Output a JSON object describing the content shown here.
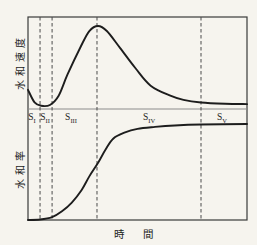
{
  "figure": {
    "x_axis_label": "時 間",
    "y_axis_label_top": "水和速度",
    "y_axis_label_bottom": "水和率",
    "stage_labels": [
      {
        "base": "S",
        "sub": "I"
      },
      {
        "base": "S",
        "sub": "II"
      },
      {
        "base": "S",
        "sub": "III"
      },
      {
        "base": "S",
        "sub": "IV"
      },
      {
        "base": "S",
        "sub": "V"
      }
    ],
    "stage_boundaries_t": [
      5.5,
      11,
      31.5,
      79
    ]
  },
  "colors": {
    "background": "#f6f4ee",
    "line": "#1d1d1d",
    "frame": "#3a3a3a",
    "divider": "#8c8c8c",
    "dashed": "#4a4a4a",
    "text": "#1d1d1d"
  },
  "chart_data": [
    {
      "type": "line",
      "panel": "top",
      "title": "",
      "xlabel": "時間",
      "ylabel": "水和速度",
      "x_unit": "relative time (0-100, unlabeled qualitative axis)",
      "y_unit": "relative hydration rate (0-1, unlabeled qualitative axis)",
      "grid": false,
      "legend": "none",
      "points": [
        [
          0,
          0.24
        ],
        [
          3,
          0.09
        ],
        [
          6,
          0.05
        ],
        [
          10,
          0.06
        ],
        [
          14,
          0.17
        ],
        [
          18,
          0.42
        ],
        [
          24,
          0.75
        ],
        [
          28,
          0.94
        ],
        [
          32,
          1.0
        ],
        [
          36,
          0.94
        ],
        [
          42,
          0.74
        ],
        [
          49,
          0.5
        ],
        [
          56,
          0.29
        ],
        [
          65,
          0.17
        ],
        [
          71,
          0.12
        ],
        [
          79,
          0.09
        ],
        [
          90,
          0.075
        ],
        [
          100,
          0.07
        ]
      ]
    },
    {
      "type": "line",
      "panel": "bottom",
      "title": "",
      "xlabel": "時間",
      "ylabel": "水和率",
      "x_unit": "relative time (0-100, unlabeled qualitative axis)",
      "y_unit": "relative degree of hydration (0-1, unlabeled qualitative axis)",
      "grid": false,
      "legend": "none",
      "points": [
        [
          0,
          0.01
        ],
        [
          5.5,
          0.015
        ],
        [
          11,
          0.04
        ],
        [
          15.5,
          0.1
        ],
        [
          20,
          0.19
        ],
        [
          24.5,
          0.32
        ],
        [
          28,
          0.46
        ],
        [
          32,
          0.6
        ],
        [
          35.5,
          0.74
        ],
        [
          39,
          0.85
        ],
        [
          44,
          0.91
        ],
        [
          50,
          0.95
        ],
        [
          58,
          0.97
        ],
        [
          67,
          0.985
        ],
        [
          79,
          0.995
        ],
        [
          100,
          1.0
        ]
      ]
    }
  ]
}
